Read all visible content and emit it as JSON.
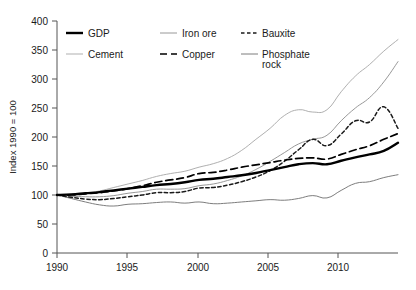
{
  "chart_data": {
    "type": "line",
    "title": "",
    "subtitle": "",
    "xlabel": "",
    "ylabel": "Index 1990 = 100",
    "xlim": [
      1990,
      2014
    ],
    "ylim": [
      0,
      400
    ],
    "ytick_labels": [
      "0",
      "50",
      "100",
      "150",
      "200",
      "250",
      "300",
      "350",
      "400"
    ],
    "yticks": [
      0,
      50,
      100,
      150,
      200,
      250,
      300,
      350,
      400
    ],
    "xtick_labels": [
      "1990",
      "1995",
      "2000",
      "2005",
      "2010"
    ],
    "xticks": [
      1990,
      1995,
      2000,
      2005,
      2010
    ],
    "grid": false,
    "legend_position": "top-left-inside",
    "x": [
      1990,
      1991,
      1992,
      1993,
      1994,
      1995,
      1996,
      1997,
      1998,
      1999,
      2000,
      2001,
      2002,
      2003,
      2004,
      2005,
      2006,
      2007,
      2008,
      2009,
      2010,
      2011,
      2012,
      2013,
      2014
    ],
    "series": [
      {
        "name": "GDP",
        "style": "solid-thick",
        "color": "#000000",
        "values": [
          100,
          101,
          103,
          105,
          108,
          111,
          114,
          117,
          119,
          122,
          126,
          128,
          131,
          134,
          138,
          143,
          148,
          153,
          155,
          153,
          159,
          165,
          170,
          176,
          190
        ]
      },
      {
        "name": "Iron ore",
        "style": "solid-thin",
        "color": "#8c8c8c",
        "values": [
          100,
          98,
          97,
          97,
          99,
          103,
          106,
          110,
          110,
          111,
          116,
          119,
          125,
          133,
          144,
          158,
          173,
          188,
          196,
          203,
          228,
          250,
          268,
          295,
          330
        ]
      },
      {
        "name": "Bauxite",
        "style": "dotted-dash",
        "color": "#1a1a1a",
        "values": [
          100,
          96,
          93,
          92,
          94,
          97,
          100,
          104,
          104,
          106,
          112,
          113,
          117,
          123,
          131,
          142,
          158,
          178,
          196,
          185,
          205,
          228,
          226,
          252,
          215
        ]
      },
      {
        "name": "Cement",
        "style": "solid-thin-light",
        "color": "#a6a6a6",
        "values": [
          100,
          101,
          103,
          107,
          113,
          119,
          125,
          132,
          137,
          141,
          148,
          154,
          163,
          177,
          196,
          215,
          237,
          247,
          243,
          247,
          278,
          305,
          325,
          348,
          368
        ]
      },
      {
        "name": "Copper",
        "style": "dashed",
        "color": "#000000",
        "values": [
          100,
          100,
          102,
          104,
          107,
          111,
          116,
          122,
          126,
          130,
          137,
          139,
          143,
          148,
          152,
          156,
          160,
          163,
          164,
          162,
          170,
          178,
          185,
          196,
          206
        ]
      },
      {
        "name": "Phosphate rock",
        "style": "solid-thin",
        "color": "#6e6e6e",
        "values": [
          100,
          94,
          88,
          83,
          81,
          84,
          85,
          87,
          88,
          86,
          88,
          85,
          86,
          88,
          90,
          92,
          91,
          94,
          99,
          95,
          108,
          120,
          123,
          130,
          135
        ]
      }
    ]
  },
  "axis": {
    "ylabel": "Index 1990 = 100",
    "ytick_0": "0",
    "ytick_50": "50",
    "ytick_100": "100",
    "ytick_150": "150",
    "ytick_200": "200",
    "ytick_250": "250",
    "ytick_300": "300",
    "ytick_350": "350",
    "ytick_400": "400",
    "xtick_1990": "1990",
    "xtick_1995": "1995",
    "xtick_2000": "2000",
    "xtick_2005": "2005",
    "xtick_2010": "2010"
  },
  "legend": {
    "items": [
      {
        "label": "GDP",
        "style": "solid-thick",
        "color": "#000000"
      },
      {
        "label": "Iron ore",
        "style": "solid-thin",
        "color": "#8c8c8c"
      },
      {
        "label": "Bauxite",
        "style": "dotted-dash",
        "color": "#1a1a1a"
      },
      {
        "label": "Cement",
        "style": "solid-thin-light",
        "color": "#a6a6a6"
      },
      {
        "label": "Copper",
        "style": "dashed",
        "color": "#000000"
      },
      {
        "label": "Phosphate",
        "label2": "rock",
        "style": "solid-thin",
        "color": "#6e6e6e"
      }
    ]
  }
}
